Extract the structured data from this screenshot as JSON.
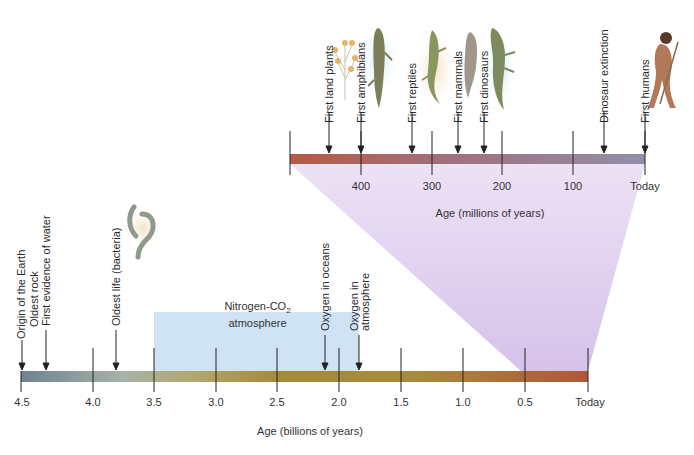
{
  "colors": {
    "bottom_bar_start": "#6f8294",
    "bottom_bar_mid1": "#a9b59a",
    "bottom_bar_mid2": "#a88a3c",
    "bottom_bar_end": "#b0563a",
    "top_bar_start": "#b55a45",
    "top_bar_end": "#8f90a8",
    "zoom_wedge": "#d9c5ea",
    "atmosphere_box": "#cfe3f5",
    "tick": "#222222"
  },
  "top_timeline": {
    "axis_title": "Age (millions of years)",
    "ticks": [
      {
        "label": "400",
        "value": 400
      },
      {
        "label": "300",
        "value": 300
      },
      {
        "label": "200",
        "value": 200
      },
      {
        "label": "100",
        "value": 100
      },
      {
        "label": "Today",
        "value": 0
      }
    ],
    "events": [
      {
        "label": "First land plants",
        "approx_mya": 475
      },
      {
        "label": "First amphibians",
        "approx_mya": 400
      },
      {
        "label": "First reptiles",
        "approx_mya": 320
      },
      {
        "label": "First mammals",
        "approx_mya": 260
      },
      {
        "label": "First dinosaurs",
        "approx_mya": 230
      },
      {
        "label": "Dinosaur extinction",
        "approx_mya": 65
      },
      {
        "label": "First humans",
        "approx_mya": 0
      }
    ],
    "illustrations": [
      "plant-illustration",
      "amphibian-illustration",
      "reptile-illustration",
      "mammal-illustration",
      "dinosaur-illustration",
      "human-illustration"
    ]
  },
  "bottom_timeline": {
    "axis_title": "Age (billions of years)",
    "ticks": [
      {
        "label": "4.5",
        "value": 4.5
      },
      {
        "label": "4.0",
        "value": 4.0
      },
      {
        "label": "3.5",
        "value": 3.5
      },
      {
        "label": "3.0",
        "value": 3.0
      },
      {
        "label": "2.5",
        "value": 2.5
      },
      {
        "label": "2.0",
        "value": 2.0
      },
      {
        "label": "1.5",
        "value": 1.5
      },
      {
        "label": "1.0",
        "value": 1.0
      },
      {
        "label": "0.5",
        "value": 0.5
      },
      {
        "label": "Today",
        "value": 0
      }
    ],
    "events": [
      {
        "label": "Origin of the Earth",
        "approx_bya": 4.5
      },
      {
        "label": "Oldest rock",
        "approx_bya": 4.4
      },
      {
        "label": "First evidence of water",
        "approx_bya": 4.3
      },
      {
        "label": "Oldest life (bacteria)",
        "approx_bya": 3.8
      },
      {
        "label": "Oxygen in oceans",
        "approx_bya": 2.1
      },
      {
        "label_line1": "Oxygen in",
        "label_line2": "atmosphere",
        "approx_bya": 1.8
      }
    ],
    "atmosphere_period": {
      "label_line1": "Nitrogen-CO",
      "label_sub": "2",
      "label_line2": "atmosphere",
      "from_bya": 3.5,
      "to_bya": 1.9
    },
    "illustrations": [
      "bacteria-illustration"
    ]
  }
}
